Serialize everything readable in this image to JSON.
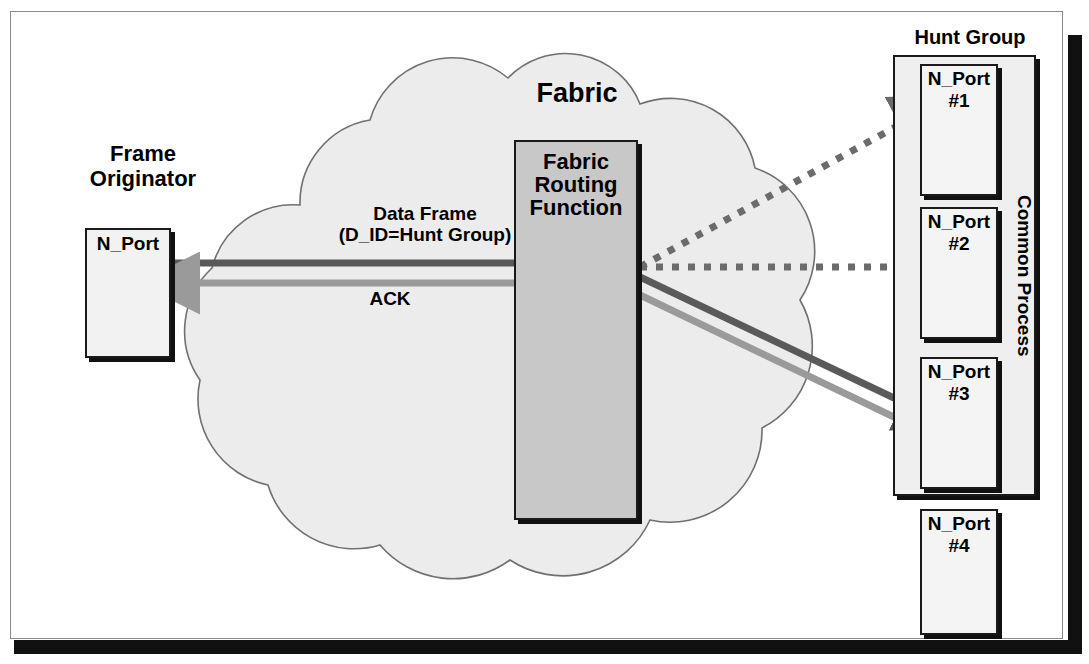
{
  "diagram": {
    "title_labels": {
      "frame_originator": "Frame\nOriginator",
      "frame_originator_line1": "Frame",
      "frame_originator_line2": "Originator",
      "fabric": "Fabric",
      "hunt_group": "Hunt Group",
      "common_process": "Common Process"
    },
    "boxes": {
      "n_port_originator": {
        "label": "N_Port"
      },
      "fabric_routing_function": {
        "line1": "Fabric",
        "line2": "Routing",
        "line3": "Function",
        "full": "Fabric Routing Function"
      }
    },
    "hunt_group_ports": [
      {
        "name": "N_Port",
        "number": "#1",
        "in_hunt_group": true
      },
      {
        "name": "N_Port",
        "number": "#2",
        "in_hunt_group": true
      },
      {
        "name": "N_Port",
        "number": "#3",
        "in_hunt_group": true
      },
      {
        "name": "N_Port",
        "number": "#4",
        "in_hunt_group": false
      }
    ],
    "flows": [
      {
        "id": "data-frame",
        "line1": "Data Frame",
        "line2": "(D_ID=Hunt Group)",
        "style": "solid",
        "color": "#5a5a5a",
        "direction": "originator-to-fabric"
      },
      {
        "id": "ack",
        "label": "ACK",
        "style": "solid",
        "color": "#9a9a9a",
        "direction": "fabric-to-originator"
      },
      {
        "id": "candidate-port-1",
        "style": "dotted",
        "color": "#6b6b6b",
        "target": "N_Port #1"
      },
      {
        "id": "candidate-port-2",
        "style": "dotted",
        "color": "#6b6b6b",
        "target": "N_Port #2"
      },
      {
        "id": "delivered-frame-port-3",
        "style": "solid",
        "color": "#5a5a5a",
        "target": "N_Port #3"
      },
      {
        "id": "ack-from-port-3",
        "style": "solid",
        "color": "#9a9a9a",
        "target": "Fabric Routing Function"
      }
    ],
    "colors": {
      "cloud_fill": "#ececec",
      "cloud_stroke": "#707070",
      "routing_fill": "#c8c8c8",
      "box_fill": "#f2f2f2",
      "hunt_group_fill": "#efefef",
      "outline": "#1a1a1a",
      "dark_line": "#5a5a5a",
      "light_line": "#9a9a9a",
      "frame_black": "#111111"
    }
  }
}
